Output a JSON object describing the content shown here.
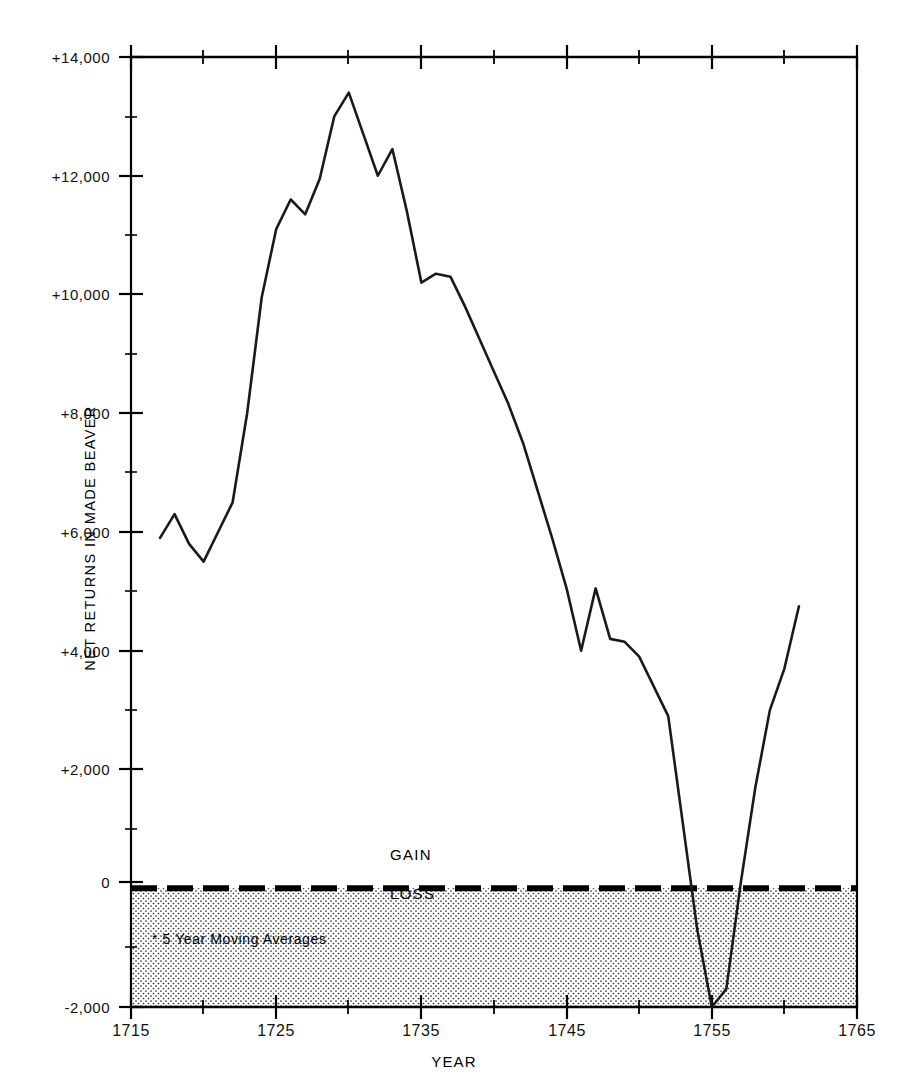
{
  "chart_data": {
    "type": "line",
    "title": "",
    "xlabel": "YEAR",
    "ylabel": "NET RETURNS IN MADE BEAVER",
    "xlim": [
      1715,
      1765
    ],
    "ylim": [
      -2000,
      14000
    ],
    "xticks": [
      1715,
      1725,
      1735,
      1745,
      1755,
      1765
    ],
    "xtick_labels": [
      "1715",
      "1725",
      "1735",
      "1745",
      "1755",
      "1765"
    ],
    "xminor_tick_interval": 5,
    "yticks": [
      -2000,
      0,
      2000,
      4000,
      6000,
      8000,
      10000,
      12000,
      14000
    ],
    "ytick_labels": [
      "-2,000",
      "0",
      "+2,000",
      "+4,000",
      "+6,000",
      "+8,000",
      "+10,000",
      "+12,000",
      "+14,000"
    ],
    "grid": false,
    "legend": null,
    "annotations": {
      "gain": "GAIN",
      "loss": "LOSS",
      "footnote": "* 5 Year Moving Averages",
      "zero_line_value": 0,
      "loss_shaded_range": [
        -2000,
        0
      ]
    },
    "series": [
      {
        "name": "Net returns in made beaver (5 year moving average)",
        "x": [
          1717,
          1718,
          1719,
          1720,
          1721,
          1722,
          1723,
          1724,
          1725,
          1726,
          1727,
          1728,
          1729,
          1730,
          1731,
          1732,
          1733,
          1734,
          1735,
          1736,
          1737,
          1738,
          1739,
          1740,
          1741,
          1742,
          1743,
          1744,
          1745,
          1746,
          1747,
          1748,
          1749,
          1750,
          1751,
          1752,
          1753,
          1754,
          1755,
          1756,
          1757,
          1758,
          1759,
          1760,
          1761
        ],
        "y": [
          5900,
          6300,
          5800,
          5500,
          6000,
          6500,
          8000,
          9950,
          11100,
          11600,
          11350,
          11950,
          13000,
          13400,
          12700,
          12000,
          12450,
          11400,
          10200,
          10350,
          10300,
          9800,
          9250,
          8700,
          8150,
          7500,
          6700,
          5900,
          5050,
          4000,
          5050,
          4200,
          4150,
          3900,
          3400,
          2900,
          1100,
          -700,
          -2000,
          -1700,
          100,
          1700,
          3000,
          3700,
          4750
        ]
      }
    ]
  },
  "colors": {
    "line": "#1a1a1a",
    "axis": "#000000",
    "shading": "#000000",
    "background": "#ffffff"
  },
  "icons": {
    "tick": "tick-mark"
  }
}
